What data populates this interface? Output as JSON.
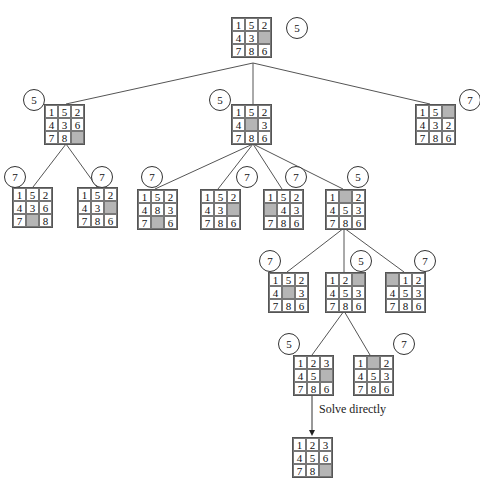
{
  "diagram": {
    "type": "8-puzzle search tree",
    "nodes": [
      {
        "id": "n0",
        "x": 231,
        "y": 17,
        "tiles": [
          "1",
          "5",
          "2",
          "4",
          "3",
          "",
          "7",
          "8",
          "6"
        ],
        "cost": "5",
        "cx": 286,
        "cy": 17
      },
      {
        "id": "n1",
        "x": 44,
        "y": 104,
        "tiles": [
          "1",
          "5",
          "2",
          "4",
          "3",
          "6",
          "7",
          "8",
          ""
        ],
        "cost": "5",
        "cx": 23,
        "cy": 89
      },
      {
        "id": "n2",
        "x": 231,
        "y": 104,
        "tiles": [
          "1",
          "5",
          "2",
          "4",
          "",
          "3",
          "7",
          "8",
          "6"
        ],
        "cost": "5",
        "cx": 209,
        "cy": 89
      },
      {
        "id": "n3",
        "x": 415,
        "y": 104,
        "tiles": [
          "1",
          "5",
          "",
          "4",
          "3",
          "2",
          "7",
          "8",
          "6"
        ],
        "cost": "7",
        "cx": 459,
        "cy": 89
      },
      {
        "id": "n4",
        "x": 12,
        "y": 187,
        "tiles": [
          "1",
          "5",
          "2",
          "4",
          "3",
          "6",
          "7",
          "",
          "8"
        ],
        "cost": "7",
        "cx": 4,
        "cy": 166
      },
      {
        "id": "n5",
        "x": 77,
        "y": 187,
        "tiles": [
          "1",
          "5",
          "2",
          "4",
          "3",
          "",
          "7",
          "8",
          "6"
        ],
        "cost": "7",
        "cx": 91,
        "cy": 166
      },
      {
        "id": "n6",
        "x": 137,
        "y": 189,
        "tiles": [
          "1",
          "5",
          "2",
          "4",
          "8",
          "3",
          "7",
          "",
          "6"
        ],
        "cost": "7",
        "cx": 141,
        "cy": 166
      },
      {
        "id": "n7",
        "x": 200,
        "y": 189,
        "tiles": [
          "1",
          "5",
          "2",
          "4",
          "3",
          "",
          "7",
          "8",
          "6"
        ],
        "cost": "7",
        "cx": 236,
        "cy": 166
      },
      {
        "id": "n8",
        "x": 263,
        "y": 189,
        "tiles": [
          "1",
          "5",
          "2",
          "",
          "4",
          "3",
          "7",
          "8",
          "6"
        ],
        "cost": "7",
        "cx": 285,
        "cy": 166
      },
      {
        "id": "n9",
        "x": 325,
        "y": 189,
        "tiles": [
          "1",
          "",
          "2",
          "4",
          "5",
          "3",
          "7",
          "8",
          "6"
        ],
        "cost": "5",
        "cx": 347,
        "cy": 166
      },
      {
        "id": "n10",
        "x": 268,
        "y": 272,
        "tiles": [
          "1",
          "5",
          "2",
          "4",
          "",
          "3",
          "7",
          "8",
          "6"
        ],
        "cost": "7",
        "cx": 259,
        "cy": 250
      },
      {
        "id": "n11",
        "x": 325,
        "y": 272,
        "tiles": [
          "1",
          "2",
          "",
          "4",
          "5",
          "3",
          "7",
          "8",
          "6"
        ],
        "cost": "5",
        "cx": 350,
        "cy": 250
      },
      {
        "id": "n12",
        "x": 385,
        "y": 272,
        "tiles": [
          "",
          "1",
          "2",
          "4",
          "5",
          "3",
          "7",
          "8",
          "6"
        ],
        "cost": "7",
        "cx": 414,
        "cy": 250
      },
      {
        "id": "n13",
        "x": 293,
        "y": 355,
        "tiles": [
          "1",
          "2",
          "3",
          "4",
          "5",
          "",
          "7",
          "8",
          "6"
        ],
        "cost": "5",
        "cx": 278,
        "cy": 333
      },
      {
        "id": "n14",
        "x": 353,
        "y": 355,
        "tiles": [
          "1",
          "",
          "2",
          "4",
          "5",
          "3",
          "7",
          "8",
          "6"
        ],
        "cost": "7",
        "cx": 393,
        "cy": 333
      },
      {
        "id": "n15",
        "x": 292,
        "y": 437,
        "tiles": [
          "1",
          "2",
          "3",
          "4",
          "5",
          "6",
          "7",
          "8",
          ""
        ],
        "cost": null,
        "cx": null,
        "cy": null
      }
    ],
    "edges": [
      {
        "from": [
          253,
          63
        ],
        "to": [
          66,
          104
        ]
      },
      {
        "from": [
          253,
          63
        ],
        "to": [
          253,
          104
        ]
      },
      {
        "from": [
          253,
          63
        ],
        "to": [
          430,
          104
        ]
      },
      {
        "from": [
          66,
          144
        ],
        "to": [
          33,
          187
        ]
      },
      {
        "from": [
          66,
          144
        ],
        "to": [
          97,
          187
        ]
      },
      {
        "from": [
          253,
          144
        ],
        "to": [
          155,
          189
        ]
      },
      {
        "from": [
          253,
          144
        ],
        "to": [
          218,
          189
        ]
      },
      {
        "from": [
          253,
          144
        ],
        "to": [
          282,
          189
        ]
      },
      {
        "from": [
          253,
          144
        ],
        "to": [
          343,
          189
        ]
      },
      {
        "from": [
          344,
          228
        ],
        "to": [
          287,
          272
        ]
      },
      {
        "from": [
          344,
          228
        ],
        "to": [
          344,
          272
        ]
      },
      {
        "from": [
          344,
          228
        ],
        "to": [
          404,
          272
        ]
      },
      {
        "from": [
          344,
          311
        ],
        "to": [
          312,
          355
        ]
      },
      {
        "from": [
          344,
          311
        ],
        "to": [
          370,
          355
        ]
      }
    ],
    "arrow": {
      "from": [
        312,
        394
      ],
      "to": [
        312,
        436
      ],
      "label": "Solve directly",
      "lx": 319,
      "ly": 409
    },
    "colors": {
      "blank_tile": "#b5b5b5",
      "line": "#555555"
    }
  }
}
